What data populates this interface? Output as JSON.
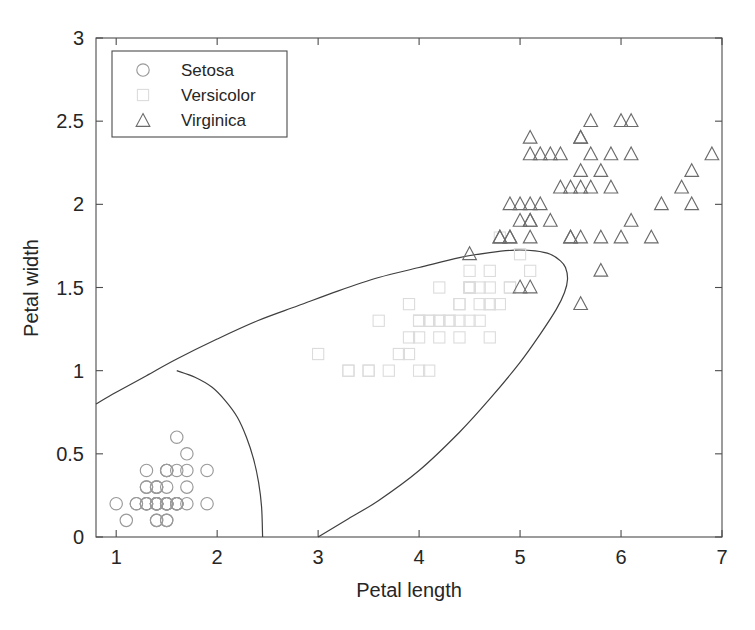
{
  "chart_data": {
    "type": "scatter",
    "title": "",
    "xlabel": "Petal length",
    "ylabel": "Petal width",
    "xlim": [
      0.8,
      7.0
    ],
    "ylim": [
      0.0,
      3.0
    ],
    "xticks": [
      1,
      2,
      3,
      4,
      5,
      6,
      7
    ],
    "xticklabels": [
      "1",
      "2",
      "3",
      "4",
      "5",
      "6",
      "7"
    ],
    "yticks": [
      0,
      0.5,
      1,
      1.5,
      2,
      2.5,
      3
    ],
    "yticklabels": [
      "0",
      "0.5",
      "1",
      "1.5",
      "2",
      "2.5",
      "3"
    ],
    "grid": false,
    "legend_position": "upper left",
    "legend_entries": [
      {
        "label": "Setosa",
        "marker": "circle",
        "color": "#9a9a9a"
      },
      {
        "label": "Versicolor",
        "marker": "square",
        "color": "#dcdcdc"
      },
      {
        "label": "Virginica",
        "marker": "triangle",
        "color": "#6b6b6b"
      }
    ],
    "series": [
      {
        "name": "Setosa",
        "marker": "circle",
        "color": "#9a9a9a",
        "points": [
          [
            1.4,
            0.2
          ],
          [
            1.4,
            0.2
          ],
          [
            1.3,
            0.2
          ],
          [
            1.5,
            0.2
          ],
          [
            1.4,
            0.2
          ],
          [
            1.7,
            0.4
          ],
          [
            1.4,
            0.3
          ],
          [
            1.5,
            0.2
          ],
          [
            1.4,
            0.2
          ],
          [
            1.5,
            0.1
          ],
          [
            1.5,
            0.2
          ],
          [
            1.6,
            0.2
          ],
          [
            1.4,
            0.1
          ],
          [
            1.1,
            0.1
          ],
          [
            1.2,
            0.2
          ],
          [
            1.5,
            0.4
          ],
          [
            1.3,
            0.4
          ],
          [
            1.4,
            0.3
          ],
          [
            1.7,
            0.3
          ],
          [
            1.5,
            0.3
          ],
          [
            1.7,
            0.2
          ],
          [
            1.5,
            0.4
          ],
          [
            1.0,
            0.2
          ],
          [
            1.7,
            0.5
          ],
          [
            1.9,
            0.2
          ],
          [
            1.6,
            0.2
          ],
          [
            1.6,
            0.4
          ],
          [
            1.5,
            0.2
          ],
          [
            1.4,
            0.2
          ],
          [
            1.6,
            0.2
          ],
          [
            1.6,
            0.2
          ],
          [
            1.5,
            0.4
          ],
          [
            1.5,
            0.1
          ],
          [
            1.4,
            0.2
          ],
          [
            1.5,
            0.2
          ],
          [
            1.2,
            0.2
          ],
          [
            1.3,
            0.2
          ],
          [
            1.4,
            0.1
          ],
          [
            1.3,
            0.2
          ],
          [
            1.5,
            0.2
          ],
          [
            1.3,
            0.3
          ],
          [
            1.3,
            0.3
          ],
          [
            1.3,
            0.2
          ],
          [
            1.6,
            0.6
          ],
          [
            1.9,
            0.4
          ],
          [
            1.4,
            0.3
          ],
          [
            1.6,
            0.2
          ],
          [
            1.4,
            0.2
          ],
          [
            1.5,
            0.2
          ],
          [
            1.4,
            0.2
          ]
        ]
      },
      {
        "name": "Versicolor",
        "marker": "square",
        "color": "#dcdcdc",
        "points": [
          [
            4.7,
            1.4
          ],
          [
            4.5,
            1.5
          ],
          [
            4.9,
            1.5
          ],
          [
            4.0,
            1.3
          ],
          [
            4.6,
            1.5
          ],
          [
            4.5,
            1.3
          ],
          [
            4.7,
            1.6
          ],
          [
            3.3,
            1.0
          ],
          [
            4.6,
            1.3
          ],
          [
            3.9,
            1.4
          ],
          [
            3.5,
            1.0
          ],
          [
            4.2,
            1.5
          ],
          [
            4.0,
            1.0
          ],
          [
            4.7,
            1.4
          ],
          [
            3.6,
            1.3
          ],
          [
            4.4,
            1.4
          ],
          [
            4.5,
            1.5
          ],
          [
            4.1,
            1.0
          ],
          [
            4.5,
            1.5
          ],
          [
            3.9,
            1.1
          ],
          [
            4.8,
            1.8
          ],
          [
            4.0,
            1.3
          ],
          [
            4.9,
            1.5
          ],
          [
            4.7,
            1.2
          ],
          [
            4.3,
            1.3
          ],
          [
            4.4,
            1.4
          ],
          [
            4.8,
            1.4
          ],
          [
            5.0,
            1.7
          ],
          [
            4.5,
            1.5
          ],
          [
            3.5,
            1.0
          ],
          [
            3.8,
            1.1
          ],
          [
            3.7,
            1.0
          ],
          [
            3.9,
            1.2
          ],
          [
            5.1,
            1.6
          ],
          [
            4.5,
            1.5
          ],
          [
            4.5,
            1.6
          ],
          [
            4.7,
            1.5
          ],
          [
            4.4,
            1.3
          ],
          [
            4.1,
            1.3
          ],
          [
            4.0,
            1.3
          ],
          [
            4.4,
            1.2
          ],
          [
            4.6,
            1.4
          ],
          [
            4.0,
            1.2
          ],
          [
            3.3,
            1.0
          ],
          [
            4.2,
            1.3
          ],
          [
            4.2,
            1.2
          ],
          [
            4.2,
            1.3
          ],
          [
            4.3,
            1.3
          ],
          [
            3.0,
            1.1
          ],
          [
            4.1,
            1.3
          ]
        ]
      },
      {
        "name": "Virginica",
        "marker": "triangle",
        "color": "#6b6b6b",
        "points": [
          [
            6.0,
            2.5
          ],
          [
            5.1,
            1.9
          ],
          [
            5.9,
            2.1
          ],
          [
            5.6,
            1.8
          ],
          [
            5.8,
            2.2
          ],
          [
            6.6,
            2.1
          ],
          [
            4.5,
            1.7
          ],
          [
            6.3,
            1.8
          ],
          [
            5.8,
            1.8
          ],
          [
            6.1,
            2.5
          ],
          [
            5.1,
            2.0
          ],
          [
            5.3,
            1.9
          ],
          [
            5.5,
            2.1
          ],
          [
            5.0,
            2.0
          ],
          [
            5.1,
            2.4
          ],
          [
            5.3,
            2.3
          ],
          [
            5.5,
            1.8
          ],
          [
            6.7,
            2.2
          ],
          [
            6.9,
            2.3
          ],
          [
            5.0,
            1.5
          ],
          [
            5.7,
            2.3
          ],
          [
            4.9,
            2.0
          ],
          [
            6.7,
            2.0
          ],
          [
            4.9,
            1.8
          ],
          [
            5.7,
            2.1
          ],
          [
            6.0,
            1.8
          ],
          [
            4.8,
            1.8
          ],
          [
            4.9,
            1.8
          ],
          [
            5.6,
            2.1
          ],
          [
            5.8,
            1.6
          ],
          [
            6.1,
            1.9
          ],
          [
            6.4,
            2.0
          ],
          [
            5.6,
            2.2
          ],
          [
            5.1,
            1.5
          ],
          [
            5.6,
            1.4
          ],
          [
            6.1,
            2.3
          ],
          [
            5.6,
            2.4
          ],
          [
            5.5,
            1.8
          ],
          [
            4.8,
            1.8
          ],
          [
            5.4,
            2.1
          ],
          [
            5.6,
            2.4
          ],
          [
            5.1,
            2.3
          ],
          [
            5.1,
            1.9
          ],
          [
            5.9,
            2.3
          ],
          [
            5.7,
            2.5
          ],
          [
            5.2,
            2.3
          ],
          [
            5.0,
            1.9
          ],
          [
            5.2,
            2.0
          ],
          [
            5.4,
            2.3
          ],
          [
            5.1,
            1.8
          ]
        ]
      }
    ],
    "boundaries": [
      {
        "name": "setosa-versicolor-boundary",
        "description": "upper quadratic discriminant curve separating setosa region from versicolor region",
        "points": [
          [
            0.8,
            0.8
          ],
          [
            1.0,
            0.87
          ],
          [
            1.3,
            0.97
          ],
          [
            1.6,
            1.07
          ],
          [
            2.0,
            1.19
          ],
          [
            2.4,
            1.3
          ],
          [
            2.8,
            1.39
          ],
          [
            3.2,
            1.48
          ],
          [
            3.6,
            1.56
          ],
          [
            4.0,
            1.62
          ],
          [
            4.4,
            1.68
          ],
          [
            4.7,
            1.71
          ],
          [
            4.95,
            1.725
          ],
          [
            5.15,
            1.72
          ],
          [
            5.3,
            1.7
          ],
          [
            5.4,
            1.66
          ],
          [
            5.45,
            1.62
          ],
          [
            5.47,
            1.55
          ],
          [
            5.44,
            1.47
          ],
          [
            5.36,
            1.37
          ],
          [
            5.2,
            1.22
          ],
          [
            5.0,
            1.05
          ],
          [
            4.7,
            0.83
          ],
          [
            4.4,
            0.63
          ],
          [
            4.0,
            0.4
          ],
          [
            3.6,
            0.22
          ],
          [
            3.3,
            0.11
          ],
          [
            3.0,
            0.0
          ]
        ]
      },
      {
        "name": "setosa-inner-boundary",
        "description": "short arc bounding the setosa cluster, from (1.6,1.0) down to (2.45,0)",
        "points": [
          [
            1.6,
            1.0
          ],
          [
            1.78,
            0.96
          ],
          [
            1.95,
            0.9
          ],
          [
            2.08,
            0.82
          ],
          [
            2.2,
            0.72
          ],
          [
            2.29,
            0.6
          ],
          [
            2.36,
            0.47
          ],
          [
            2.41,
            0.33
          ],
          [
            2.44,
            0.18
          ],
          [
            2.45,
            0.0
          ]
        ]
      }
    ]
  }
}
